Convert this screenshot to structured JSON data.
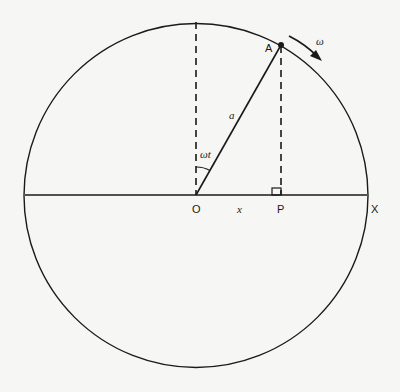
{
  "diagram": {
    "type": "circle-phasor",
    "labels": {
      "point_A": "A",
      "origin": "O",
      "point_P": "P",
      "axis_end": "X",
      "radius": "a",
      "displacement": "x",
      "angle": "ωt",
      "angular_velocity": "ω"
    },
    "colors": {
      "line": "#1a1a1a",
      "background": "#f6f6f4"
    }
  }
}
